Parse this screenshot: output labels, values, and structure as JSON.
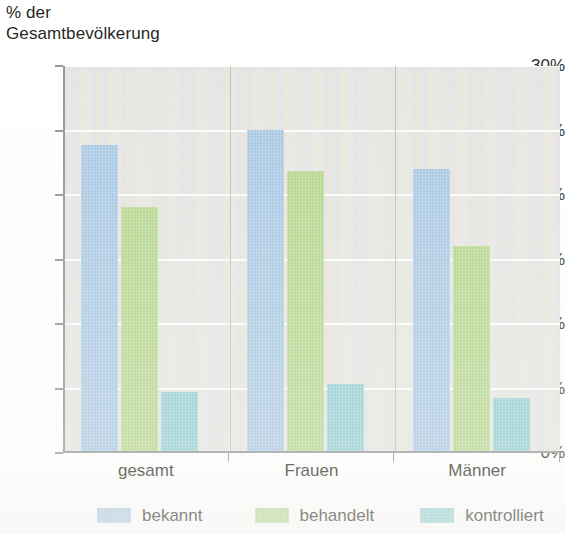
{
  "chart_data": {
    "type": "bar",
    "title": "",
    "axis_title_lines": [
      "% der",
      "Gesamtbevölkerung"
    ],
    "xlabel": "",
    "ylabel": "% der Gesamtbevölkerung",
    "categories": [
      "gesamt",
      "Frauen",
      "Männer"
    ],
    "series": [
      {
        "name": "bekannt",
        "color": "#a9cbe9",
        "values": [
          23.7,
          24.9,
          21.9
        ]
      },
      {
        "name": "behandelt",
        "color": "#b6d98b",
        "values": [
          18.9,
          21.7,
          15.9
        ]
      },
      {
        "name": "kontrolliert",
        "color": "#8ed0d5",
        "values": [
          4.6,
          5.2,
          4.1
        ]
      }
    ],
    "ylim": [
      0,
      30
    ],
    "ytick_step": 5,
    "ytick_labels": [
      "30%",
      "25%",
      "20%",
      "15%",
      "10%",
      "5%",
      "0%"
    ],
    "ytick_values": [
      30,
      25,
      20,
      15,
      10,
      5,
      0
    ],
    "grid": true,
    "grid_orientation": "horizontal",
    "grid_color": "#ffffff",
    "legend_position": "bottom",
    "legend_entries": [
      "bekannt",
      "behandelt",
      "kontrolliert"
    ],
    "plot_background": "#eceae6",
    "axis_color": "#8f9193"
  }
}
